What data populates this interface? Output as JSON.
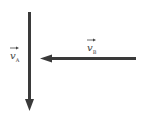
{
  "diagram": {
    "type": "vector-diagram",
    "colors": {
      "arrow": "#3a3a3a",
      "label": "#444444",
      "background": "#ffffff"
    },
    "vectors": [
      {
        "id": "vA",
        "symbol": "v",
        "subscript": "A",
        "direction": "down",
        "from": [
          29,
          12
        ],
        "to": [
          29,
          110
        ]
      },
      {
        "id": "vB",
        "symbol": "v",
        "subscript": "B",
        "direction": "left",
        "from": [
          136,
          58
        ],
        "to": [
          40,
          58
        ]
      }
    ]
  }
}
